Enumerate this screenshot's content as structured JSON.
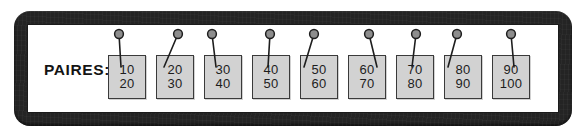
{
  "frame": {
    "color": "#242424",
    "panel_color": "#ffffff"
  },
  "label": {
    "text": "PAIRES:"
  },
  "card_style": {
    "fill": "#d2d2d2",
    "border": "#3a3a3a",
    "text_color": "#1d1d1d",
    "pin_head_fill": "#8d8d8d",
    "pin_outline": "#1e1e1e"
  },
  "cards": [
    {
      "top": "10",
      "bottom": "20",
      "x": 0,
      "pin_dx": 11,
      "pin_tilt": -2
    },
    {
      "top": "20",
      "bottom": "30",
      "x": 48,
      "pin_dx": 22,
      "pin_tilt": 14
    },
    {
      "top": "30",
      "bottom": "40",
      "x": 96,
      "pin_dx": 8,
      "pin_tilt": -4
    },
    {
      "top": "40",
      "bottom": "50",
      "x": 144,
      "pin_dx": 18,
      "pin_tilt": 2
    },
    {
      "top": "50",
      "bottom": "60",
      "x": 192,
      "pin_dx": 14,
      "pin_tilt": 10
    },
    {
      "top": "60",
      "bottom": "70",
      "x": 240,
      "pin_dx": 21,
      "pin_tilt": -8
    },
    {
      "top": "70",
      "bottom": "80",
      "x": 288,
      "pin_dx": 20,
      "pin_tilt": 4
    },
    {
      "top": "80",
      "bottom": "90",
      "x": 336,
      "pin_dx": 13,
      "pin_tilt": 9
    },
    {
      "top": "90",
      "bottom": "100",
      "x": 384,
      "pin_dx": 19,
      "pin_tilt": -3
    }
  ]
}
